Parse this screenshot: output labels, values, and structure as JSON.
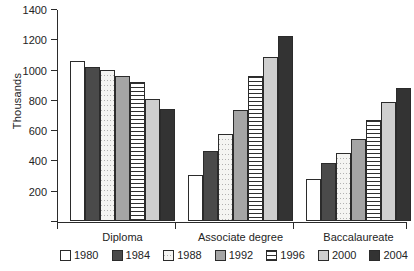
{
  "chart_data": {
    "type": "bar",
    "title": "",
    "subtitle": "",
    "xlabel": "",
    "ylabel": "Thousands",
    "ylim": [
      0,
      1400
    ],
    "ytick_values": [
      200,
      400,
      600,
      800,
      1000,
      1200,
      1400
    ],
    "ytick_labels": [
      "200",
      "400",
      "600",
      "800",
      "1000",
      "1200",
      "1400"
    ],
    "grid": false,
    "legend_position": "bottom",
    "categories": [
      "Diploma",
      "Associate degree",
      "Baccalaureate"
    ],
    "series": [
      {
        "name": "1980",
        "fill": "white",
        "values": [
          1060,
          305,
          280
        ]
      },
      {
        "name": "1984",
        "fill": "dark-gray",
        "values": [
          1020,
          460,
          380
        ]
      },
      {
        "name": "1988",
        "fill": "stipple",
        "values": [
          995,
          575,
          450
        ]
      },
      {
        "name": "1992",
        "fill": "medium-gray",
        "values": [
          955,
          730,
          540
        ]
      },
      {
        "name": "1996",
        "fill": "horizontal-stripe",
        "values": [
          915,
          960,
          670
        ]
      },
      {
        "name": "2000",
        "fill": "light-gray",
        "values": [
          805,
          1085,
          785
        ]
      },
      {
        "name": "2004",
        "fill": "near-black",
        "values": [
          740,
          1220,
          880
        ]
      }
    ]
  },
  "legend": {
    "items": [
      {
        "label": "1980"
      },
      {
        "label": "1984"
      },
      {
        "label": "1988"
      },
      {
        "label": "1992"
      },
      {
        "label": "1996"
      },
      {
        "label": "2000"
      },
      {
        "label": "2004"
      }
    ]
  },
  "colors": {
    "axis": "#2b2b2b",
    "text": "#242424",
    "background": "#ffffff"
  }
}
